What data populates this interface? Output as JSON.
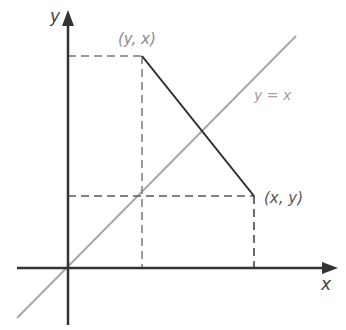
{
  "diagram": {
    "axes": {
      "x_label": "x",
      "y_label": "y",
      "color": "#333333"
    },
    "diagonal": {
      "label": "y = x",
      "color": "#a8a8a8"
    },
    "points": {
      "reflected": {
        "label": "(y, x)"
      },
      "original": {
        "label": "(x, y)"
      }
    },
    "segment_color": "#2b2b2b",
    "dash_color": "#6a6a6a",
    "label_color": "#8a8a8a"
  }
}
